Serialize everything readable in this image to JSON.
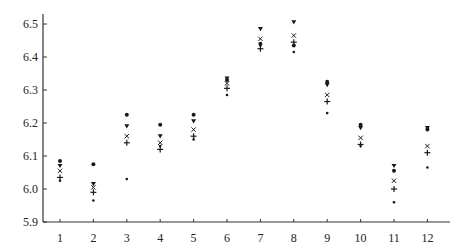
{
  "chart_data": {
    "type": "scatter",
    "title": "",
    "xlabel": "",
    "ylabel": "",
    "x": [
      1,
      2,
      3,
      4,
      5,
      6,
      7,
      8,
      9,
      10,
      11,
      12
    ],
    "xticks": [
      "1",
      "2",
      "3",
      "4",
      "5",
      "6",
      "7",
      "8",
      "9",
      "10",
      "11",
      "12"
    ],
    "yticks": [
      "5.9",
      "6.0",
      "6.1",
      "6.2",
      "6.3",
      "6.4",
      "6.5"
    ],
    "ylim": [
      5.9,
      6.52
    ],
    "grid": false,
    "legend": null,
    "series": [
      {
        "name": "circle",
        "marker": "dot",
        "values": [
          6.085,
          6.075,
          6.225,
          6.195,
          6.225,
          6.33,
          6.44,
          6.435,
          6.325,
          6.195,
          6.055,
          6.18
        ]
      },
      {
        "name": "triangle",
        "marker": "triangle-down",
        "values": [
          6.07,
          6.015,
          6.19,
          6.16,
          6.205,
          6.335,
          6.485,
          6.505,
          6.315,
          6.185,
          6.07,
          6.185
        ]
      },
      {
        "name": "cross",
        "marker": "x",
        "values": [
          6.055,
          6.005,
          6.16,
          6.14,
          6.18,
          6.32,
          6.455,
          6.465,
          6.285,
          6.155,
          6.025,
          6.13
        ]
      },
      {
        "name": "plus",
        "marker": "plus",
        "values": [
          6.035,
          5.99,
          6.14,
          6.12,
          6.16,
          6.305,
          6.425,
          6.445,
          6.265,
          6.135,
          6.0,
          6.11
        ]
      },
      {
        "name": "small-dot",
        "marker": "small-dot",
        "values": [
          6.025,
          5.965,
          6.03,
          6.13,
          6.15,
          6.285,
          6.435,
          6.415,
          6.23,
          6.13,
          5.96,
          6.065
        ]
      }
    ]
  }
}
